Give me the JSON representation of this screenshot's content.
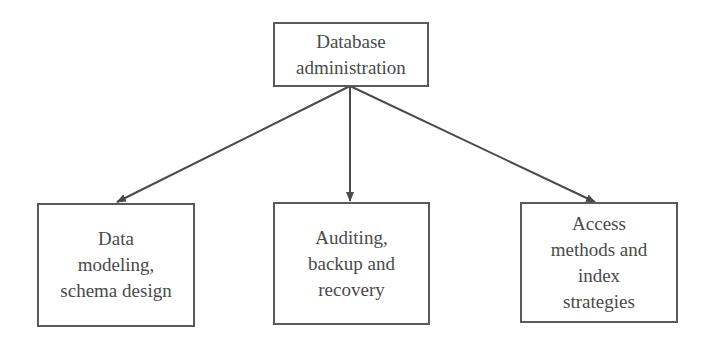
{
  "diagram": {
    "root": {
      "lines": [
        "Database",
        "administration"
      ]
    },
    "children": [
      {
        "lines": [
          "Data",
          "modeling,",
          "schema design"
        ]
      },
      {
        "lines": [
          "Auditing,",
          "backup and",
          "recovery"
        ]
      },
      {
        "lines": [
          "Access",
          "methods and",
          "index",
          "strategies"
        ]
      }
    ],
    "edges": [
      {
        "from": "root",
        "to": "children.0"
      },
      {
        "from": "root",
        "to": "children.1"
      },
      {
        "from": "root",
        "to": "children.2"
      }
    ],
    "colors": {
      "stroke": "#5a5a5a",
      "text": "#4a4a4a",
      "background": "#ffffff"
    }
  }
}
